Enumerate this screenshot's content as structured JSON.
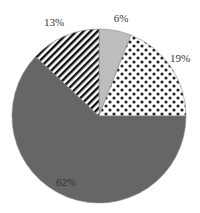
{
  "chart_data": {
    "type": "pie",
    "title": "",
    "slices": [
      {
        "label": "6%",
        "value": 6,
        "fill": "solid-light-gray",
        "color": "#bdbdbd"
      },
      {
        "label": "19%",
        "value": 19,
        "fill": "dotted",
        "color": "#ffffff"
      },
      {
        "label": "62%",
        "value": 62,
        "fill": "solid-dark-gray",
        "color": "#666666"
      },
      {
        "label": "13%",
        "value": 13,
        "fill": "diagonal-stripes",
        "color": "#ffffff"
      }
    ],
    "start_angle": "12 o'clock",
    "direction": "clockwise",
    "legend": "none"
  }
}
